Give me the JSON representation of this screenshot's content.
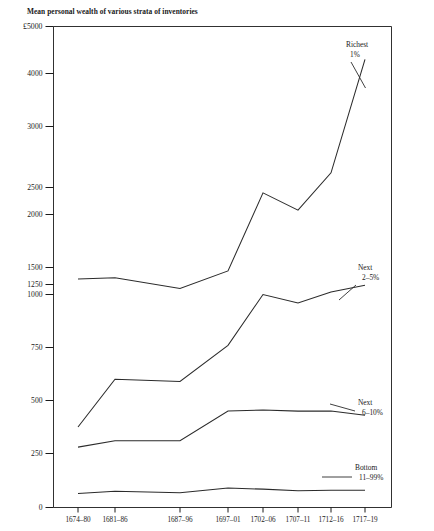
{
  "chart_data": {
    "type": "line",
    "title": "Mean personal wealth of various strata of inventories",
    "xlabel": "",
    "ylabel": "£5000",
    "y_unit_label": "£5000",
    "grid": false,
    "legend_position": "inline-right",
    "categories": [
      "1674–80",
      "1681–86",
      "1687–96",
      "1697–01",
      "1702–06",
      "1707–11",
      "1712–16",
      "1717–19"
    ],
    "y_ticks": [
      0,
      250,
      500,
      750,
      1000,
      1250,
      1500,
      2000,
      2500,
      3000,
      4000,
      5000
    ],
    "y_tick_labels": [
      "0",
      "250",
      "500",
      "750",
      "1000",
      "1250",
      "1500",
      "2000",
      "2500",
      "3000",
      "4000",
      "£5000"
    ],
    "ylim": [
      0,
      5000
    ],
    "y_scale": "non-linear piecewise (compressed above 1500)",
    "series": [
      {
        "name": "Richest 1%",
        "label_line1": "Richest",
        "label_line2": "1%",
        "values": [
          1330,
          1350,
          1150,
          1450,
          2400,
          2080,
          2620,
          4300
        ]
      },
      {
        "name": "Next 2–5%",
        "label_line1": "Next",
        "label_line2": "2–5%",
        "values": [
          375,
          600,
          590,
          760,
          1000,
          960,
          1060,
          1230
        ]
      },
      {
        "name": "Next 6–10%",
        "label_line1": "Next",
        "label_line2": "6–10%",
        "values": [
          280,
          310,
          310,
          450,
          455,
          450,
          450,
          430
        ]
      },
      {
        "name": "Bottom 11–99%",
        "label_line1": "Bottom",
        "label_line2": "11–99%",
        "values": [
          65,
          75,
          68,
          90,
          85,
          78,
          80,
          80
        ]
      }
    ]
  }
}
